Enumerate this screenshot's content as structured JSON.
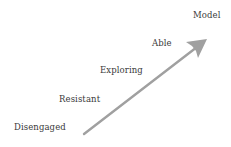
{
  "diagram": {
    "type": "progression-arrow",
    "stages": [
      {
        "label": "Disengaged",
        "x": 14,
        "y": 123
      },
      {
        "label": "Resistant",
        "x": 59,
        "y": 95
      },
      {
        "label": "Exploring",
        "x": 100,
        "y": 66
      },
      {
        "label": "Able",
        "x": 152,
        "y": 39
      },
      {
        "label": "Model",
        "x": 193,
        "y": 11
      }
    ],
    "arrow": {
      "from": [
        84,
        134
      ],
      "to": [
        207,
        39
      ],
      "color": "#9a9a9a"
    },
    "text_color": "#3a3a3a"
  }
}
